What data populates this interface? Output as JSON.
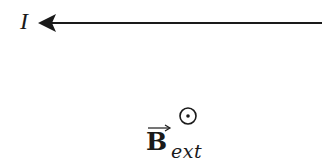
{
  "diagram": {
    "type": "physics-field-diagram",
    "current": {
      "label": "I",
      "direction": "left",
      "icon": "arrow-left-icon"
    },
    "field": {
      "symbol": "out-of-page-dot-circle",
      "icon": "dot-in-circle-icon",
      "vector_arrow": "→",
      "letter": "B",
      "subscript": "ext"
    },
    "colors": {
      "ink": "#1a1a1a",
      "background": "#ffffff"
    }
  }
}
